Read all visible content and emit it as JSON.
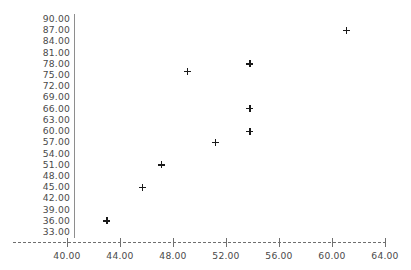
{
  "chart_data": {
    "type": "scatter",
    "title": "",
    "subtitle": "",
    "xlabel": "",
    "ylabel": "",
    "grid": false,
    "legend": null,
    "legend_position": "none",
    "marker": "plus",
    "marker_color": "#1a1a1a",
    "xlim": [
      38.0,
      66.0
    ],
    "ylim": [
      33.0,
      90.0
    ],
    "x_ticks": [
      40.0,
      44.0,
      48.0,
      52.0,
      56.0,
      60.0,
      64.0
    ],
    "x_tick_labels": [
      "40.00",
      "44.00",
      "48.00",
      "52.00",
      "56.00",
      "60.00",
      "64.00"
    ],
    "y_ticks": [
      33.0,
      36.0,
      39.0,
      42.0,
      45.0,
      48.0,
      51.0,
      54.0,
      57.0,
      60.0,
      63.0,
      66.0,
      69.0,
      72.0,
      75.0,
      78.0,
      81.0,
      84.0,
      87.0,
      90.0
    ],
    "y_tick_labels": [
      "33.00",
      "36.00",
      "39.00",
      "42.00",
      "45.00",
      "48.00",
      "51.00",
      "54.00",
      "57.00",
      "60.00",
      "63.00",
      "66.00",
      "69.00",
      "72.00",
      "75.00",
      "78.00",
      "81.00",
      "84.00",
      "87.00",
      "90.00"
    ],
    "points": [
      {
        "x": 43.0,
        "y": 36.0
      },
      {
        "x": 45.7,
        "y": 45.0
      },
      {
        "x": 47.1,
        "y": 51.0
      },
      {
        "x": 49.1,
        "y": 76.0
      },
      {
        "x": 51.2,
        "y": 57.0
      },
      {
        "x": 53.8,
        "y": 60.0
      },
      {
        "x": 53.8,
        "y": 66.0
      },
      {
        "x": 53.8,
        "y": 78.0
      },
      {
        "x": 61.1,
        "y": 87.0
      }
    ]
  }
}
